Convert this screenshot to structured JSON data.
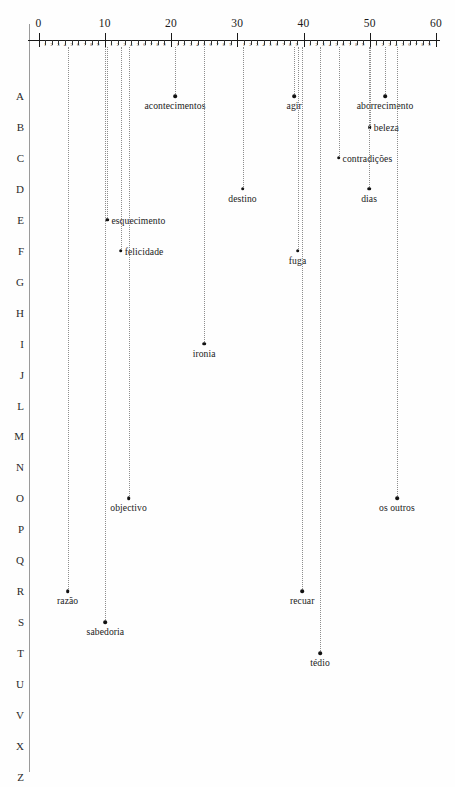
{
  "chart_data": {
    "type": "scatter",
    "title": "",
    "xlabel": "",
    "ylabel": "",
    "xlim": [
      0,
      60
    ],
    "ylim_categories": [
      "A",
      "B",
      "C",
      "D",
      "E",
      "F",
      "G",
      "H",
      "I",
      "J",
      "L",
      "M",
      "N",
      "O",
      "P",
      "Q",
      "R",
      "S",
      "T",
      "U",
      "V",
      "X",
      "Z"
    ],
    "grid": false,
    "legend": null,
    "axis": {
      "major_ticks": [
        0,
        10,
        20,
        30,
        40,
        50,
        60
      ],
      "major_tick_labels": [
        "0",
        "10",
        "20",
        "30",
        "40",
        "50",
        "60"
      ],
      "minor_tick_labels": [
        "1",
        "2",
        "3",
        "4",
        "5",
        "6",
        "7",
        "8",
        "9"
      ],
      "minor_ticks_per_major": 9
    },
    "row_labels": [
      "A",
      "B",
      "C",
      "D",
      "E",
      "F",
      "G",
      "H",
      "I",
      "J",
      "L",
      "M",
      "N",
      "O",
      "P",
      "Q",
      "R",
      "S",
      "T",
      "U",
      "V",
      "X",
      "Z"
    ],
    "points": [
      {
        "label": "acontecimentos",
        "x": 20.6,
        "row": "A",
        "label_pos": "below"
      },
      {
        "label": "agir",
        "x": 38.6,
        "row": "A",
        "label_pos": "below"
      },
      {
        "label": "aborrecimento",
        "x": 52.3,
        "row": "A",
        "label_pos": "below"
      },
      {
        "label": "beleza",
        "x": 50.0,
        "row": "B",
        "label_pos": "right"
      },
      {
        "label": "contradições",
        "x": 45.3,
        "row": "C",
        "label_pos": "right"
      },
      {
        "label": "destino",
        "x": 30.8,
        "row": "D",
        "label_pos": "below"
      },
      {
        "label": "dias",
        "x": 49.9,
        "row": "D",
        "label_pos": "below"
      },
      {
        "label": "esquecimento",
        "x": 10.4,
        "row": "E",
        "label_pos": "right"
      },
      {
        "label": "felicidade",
        "x": 12.4,
        "row": "F",
        "label_pos": "right"
      },
      {
        "label": "fuga",
        "x": 39.1,
        "row": "F",
        "label_pos": "below"
      },
      {
        "label": "ironia",
        "x": 25.0,
        "row": "I",
        "label_pos": "below"
      },
      {
        "label": "objectivo",
        "x": 13.6,
        "row": "O",
        "label_pos": "below"
      },
      {
        "label": "os outros",
        "x": 54.1,
        "row": "O",
        "label_pos": "below"
      },
      {
        "label": "razão",
        "x": 4.4,
        "row": "R",
        "label_pos": "below"
      },
      {
        "label": "recuar",
        "x": 39.8,
        "row": "R",
        "label_pos": "below"
      },
      {
        "label": "sabedoria",
        "x": 10.1,
        "row": "S",
        "label_pos": "below"
      },
      {
        "label": "tédio",
        "x": 42.5,
        "row": "T",
        "label_pos": "below"
      }
    ]
  },
  "colors": {
    "ink": "#1a1a1a",
    "stem": "#8d8d8d",
    "rule": "#9a9a9a",
    "background": "#fefefe"
  }
}
